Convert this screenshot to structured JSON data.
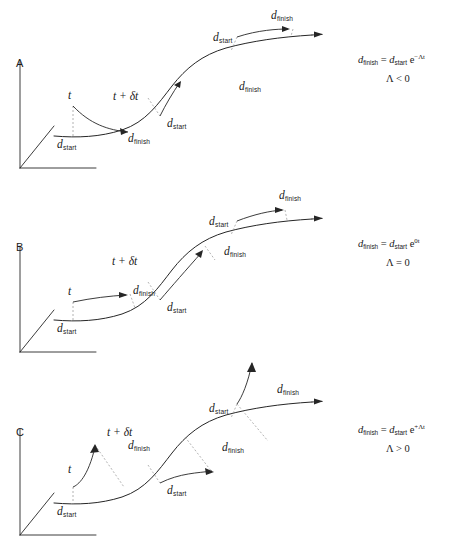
{
  "figure": {
    "type": "diagram",
    "stroke_color": "#262626",
    "dash_color": "#8a8a8a",
    "background": "#ffffff"
  },
  "symbols": {
    "d": "d",
    "sub_start": "start",
    "sub_finish": "finish",
    "time_t": "t",
    "time_t_plus": "t + δt",
    "lambda": "Λ",
    "e": "e",
    "equals": "=",
    "exponent_negative": "−Λt",
    "exponent_zero": "0t",
    "exponent_positive": "+Λt",
    "cond_less": "Λ < 0",
    "cond_equal": "Λ = 0",
    "cond_greater": "Λ > 0"
  },
  "panels": [
    {
      "id": "a",
      "letter": "A",
      "regime": "convergent",
      "equation_lhs": "d",
      "equation_lhs_sub": "finish",
      "equation_rhs": "d",
      "equation_rhs_sub": "start",
      "equation_exponent": "−Λt",
      "condition": "Λ < 0",
      "labels": {
        "time_first": "t",
        "time_second": "t + δt",
        "d_start_axis": "d",
        "d_start_axis_sub": "start",
        "d_finish_mid": "d",
        "d_finish_mid_sub": "finish",
        "d_start_mid": "d",
        "d_start_mid_sub": "start",
        "d_finish_upper": "d",
        "d_finish_upper_sub": "finish",
        "d_start_upper": "d",
        "d_start_upper_sub": "start",
        "d_finish_top": "d",
        "d_finish_top_sub": "finish"
      }
    },
    {
      "id": "b",
      "letter": "B",
      "regime": "neutral",
      "equation_lhs": "d",
      "equation_lhs_sub": "finish",
      "equation_rhs": "d",
      "equation_rhs_sub": "start",
      "equation_exponent": "0t",
      "condition": "Λ = 0",
      "labels": {
        "time_first": "t",
        "time_second": "t + δt",
        "d_start_axis": "d",
        "d_start_axis_sub": "start",
        "d_finish_mid": "d",
        "d_finish_mid_sub": "finish",
        "d_start_mid": "d",
        "d_start_mid_sub": "start",
        "d_finish_upper": "d",
        "d_finish_upper_sub": "finish",
        "d_start_upper": "d",
        "d_start_upper_sub": "start",
        "d_finish_top": "d",
        "d_finish_top_sub": "finish"
      }
    },
    {
      "id": "c",
      "letter": "C",
      "regime": "divergent",
      "equation_lhs": "d",
      "equation_lhs_sub": "finish",
      "equation_rhs": "d",
      "equation_rhs_sub": "start",
      "equation_exponent": "+Λt",
      "condition": "Λ > 0",
      "labels": {
        "time_first": "t",
        "time_second": "t + δt",
        "d_start_axis": "d",
        "d_start_axis_sub": "start",
        "d_finish_mid": "d",
        "d_finish_mid_sub": "finish",
        "d_start_mid": "d",
        "d_start_mid_sub": "start",
        "d_finish_upper": "d",
        "d_finish_upper_sub": "finish",
        "d_start_upper": "d",
        "d_start_upper_sub": "start",
        "d_finish_top": "d",
        "d_finish_top_sub": "finish"
      }
    }
  ]
}
